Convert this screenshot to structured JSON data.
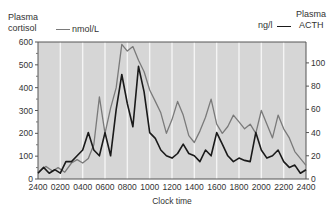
{
  "chart_data": {
    "type": "line",
    "title": "",
    "xlabel": "Clock time",
    "ylabel_left": "Plasma cortisol",
    "ylabel_right": "Plasma ACTH",
    "x_ticks": [
      "2400",
      "0200",
      "0400",
      "0600",
      "0800",
      "1000",
      "1200",
      "1400",
      "1600",
      "1800",
      "2000",
      "2200",
      "2400"
    ],
    "y_left_ticks": [
      0,
      100,
      200,
      300,
      400,
      500,
      600
    ],
    "y_right_ticks": [
      0,
      20,
      40,
      60,
      80,
      100
    ],
    "ylim_left": [
      0,
      600
    ],
    "ylim_right": [
      0,
      118
    ],
    "xlim_hours": [
      0,
      24
    ],
    "grid": "vertical white lines every 2 hours on grey background",
    "series": [
      {
        "name": "Plasma cortisol",
        "unit": "nmol/L",
        "axis": "left",
        "color": "#7a7a7a",
        "hours": [
          0,
          0.7,
          1.3,
          1.8,
          2.4,
          3,
          3.5,
          4,
          4.5,
          5,
          5.5,
          6,
          6.5,
          7,
          7.5,
          8,
          8.5,
          9,
          9.5,
          10,
          10.5,
          11,
          11.5,
          12,
          12.5,
          13,
          13.5,
          14,
          14.5,
          15,
          15.5,
          16,
          16.5,
          17,
          17.5,
          18,
          18.5,
          19,
          19.5,
          20,
          20.5,
          21,
          21.5,
          22,
          22.5,
          23,
          24
        ],
        "values": [
          30,
          55,
          35,
          50,
          30,
          70,
          85,
          70,
          90,
          150,
          360,
          200,
          310,
          400,
          590,
          560,
          580,
          520,
          470,
          390,
          340,
          290,
          200,
          260,
          340,
          280,
          190,
          160,
          210,
          270,
          350,
          240,
          200,
          230,
          280,
          250,
          220,
          240,
          200,
          300,
          240,
          180,
          280,
          220,
          180,
          120,
          60
        ]
      },
      {
        "name": "Plasma ACTH",
        "unit": "ng/l",
        "axis": "right",
        "color": "#1a1a1a",
        "hours": [
          0,
          0.5,
          1,
          1.5,
          2,
          2.5,
          3,
          3.5,
          4,
          4.5,
          5,
          5.5,
          6,
          6.5,
          7,
          7.5,
          8,
          8.5,
          9,
          9.5,
          10,
          10.5,
          11,
          11.5,
          12,
          12.5,
          13,
          13.5,
          14,
          14.5,
          15,
          15.5,
          16,
          16.5,
          17,
          17.5,
          18,
          18.5,
          19,
          19.5,
          20,
          20.5,
          21,
          21.5,
          22,
          22.5,
          23,
          23.5,
          24
        ],
        "values": [
          5,
          10,
          5,
          8,
          5,
          15,
          15,
          20,
          25,
          40,
          25,
          20,
          40,
          20,
          60,
          90,
          65,
          45,
          97,
          75,
          40,
          35,
          25,
          20,
          18,
          22,
          30,
          22,
          20,
          15,
          25,
          20,
          40,
          30,
          20,
          15,
          18,
          16,
          15,
          40,
          25,
          18,
          20,
          25,
          15,
          10,
          12,
          5,
          8
        ]
      }
    ]
  },
  "labels": {
    "left_axis_line1": "Plasma",
    "left_axis_line2": "cortisol",
    "left_legend": "nmol/L",
    "right_axis_line1": "Plasma",
    "right_axis_line2": "ACTH",
    "right_legend": "ng/l",
    "xlabel": "Clock time"
  }
}
